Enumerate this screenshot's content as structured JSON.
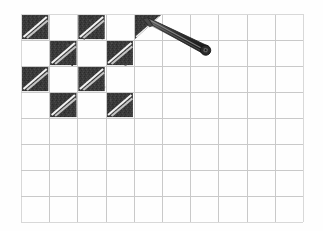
{
  "app": {
    "title": "Grid Shading Canvas",
    "background_color": "#fefefe"
  },
  "grid": {
    "name": "shading-grid",
    "columns": 10,
    "rows": 8,
    "origin_x": 21,
    "origin_y": 14,
    "cell_width": 28.2,
    "cell_height": 26.0,
    "line_color": "#c9c9c9",
    "outer_line_color": "#d8d8d8"
  },
  "shading": {
    "fill_color": "#3a3a3a",
    "fill_color_dark": "#2b2b2b",
    "highlight_stripe_color": "#f2f2f2",
    "pattern": "diagonal-hatch-with-highlight",
    "filled_cells": [
      {
        "row": 0,
        "col": 0,
        "state": "complete"
      },
      {
        "row": 0,
        "col": 2,
        "state": "complete"
      },
      {
        "row": 0,
        "col": 4,
        "state": "partial"
      },
      {
        "row": 1,
        "col": 1,
        "state": "complete"
      },
      {
        "row": 1,
        "col": 3,
        "state": "complete"
      },
      {
        "row": 2,
        "col": 0,
        "state": "complete"
      },
      {
        "row": 2,
        "col": 2,
        "state": "complete"
      },
      {
        "row": 3,
        "col": 1,
        "state": "complete"
      },
      {
        "row": 3,
        "col": 3,
        "state": "complete"
      }
    ]
  },
  "cursor": {
    "name": "stylus-pen-cursor",
    "type": "stylus",
    "tip_x": 143,
    "tip_y": 19,
    "tail_x": 204,
    "tail_y": 51,
    "body_color": "#3c3c3c",
    "outline_color": "#1d1d1d",
    "cap_color": "#2a2a2a",
    "cap_inner_color": "#6d6d6d"
  }
}
